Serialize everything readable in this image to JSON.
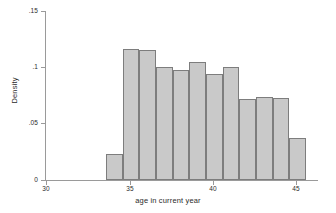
{
  "chart_data": {
    "type": "bar",
    "title": "",
    "subtitle": "",
    "xlabel": "age in current year",
    "ylabel": "Density",
    "xlim": [
      29.0,
      46.4
    ],
    "ylim": [
      0,
      0.15
    ],
    "grid": false,
    "legend": null,
    "xticks": [
      30,
      35,
      40,
      45
    ],
    "xtick_labels": [
      "30",
      "35",
      "40",
      "45"
    ],
    "yticks": [
      0,
      0.05,
      0.1,
      0.15
    ],
    "ytick_labels": [
      "0",
      ".05",
      ".1",
      ".15"
    ],
    "bin_width": 1,
    "bin_edges": [
      33.6,
      34.6,
      35.6,
      36.6,
      37.6,
      38.6,
      39.6,
      40.6,
      41.6,
      42.6,
      43.6,
      44.6,
      45.6
    ],
    "categories": [
      "33.6-34.6",
      "34.6-35.6",
      "35.6-36.6",
      "36.6-37.6",
      "37.6-38.6",
      "38.6-39.6",
      "39.6-40.6",
      "40.6-41.6",
      "41.6-42.6",
      "42.6-43.6",
      "43.6-44.6",
      "44.6-45.6"
    ],
    "values": [
      0.023,
      0.116,
      0.115,
      0.1,
      0.098,
      0.105,
      0.094,
      0.1,
      0.072,
      0.074,
      0.073,
      0.037
    ],
    "bar_fill_color": "#c9c9c9",
    "bar_edge_color": "#7d7d7d",
    "axis_color": "#9a9a9a",
    "background_color": "#ffffff"
  }
}
